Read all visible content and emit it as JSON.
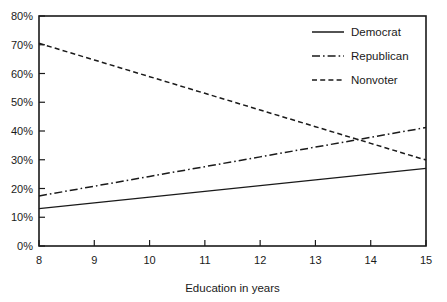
{
  "chart_data": {
    "type": "line",
    "title": "",
    "xlabel": "Education in years",
    "ylabel": "",
    "x": [
      8,
      9,
      10,
      11,
      12,
      13,
      14,
      15
    ],
    "xlim": [
      8,
      15
    ],
    "ylim": [
      0,
      80
    ],
    "grid": false,
    "legend_position": "top-right",
    "x_ticks": [
      "8",
      "9",
      "10",
      "11",
      "12",
      "13",
      "14",
      "15"
    ],
    "y_ticks": [
      "0%",
      "10%",
      "20%",
      "30%",
      "40%",
      "50%",
      "60%",
      "70%",
      "80%"
    ],
    "y_tick_values": [
      0,
      10,
      20,
      30,
      40,
      50,
      60,
      70,
      80
    ],
    "series": [
      {
        "name": "Democrat",
        "style": "solid",
        "color": "#1a1a1a",
        "values": [
          13,
          15,
          17,
          19,
          21,
          23,
          25,
          27
        ]
      },
      {
        "name": "Republican",
        "style": "dash-dot",
        "color": "#1a1a1a",
        "values": [
          17.4,
          20.8,
          24.2,
          27.6,
          31.0,
          34.4,
          37.8,
          41.2
        ]
      },
      {
        "name": "Nonvoter",
        "style": "dashed",
        "color": "#1a1a1a",
        "values": [
          70.5,
          64.7,
          58.9,
          53.1,
          47.3,
          41.5,
          35.7,
          29.9
        ]
      }
    ]
  },
  "legend": {
    "entries": [
      {
        "label": "Democrat",
        "style": "solid"
      },
      {
        "label": "Republican",
        "style": "dash-dot"
      },
      {
        "label": "Nonvoter",
        "style": "dashed"
      }
    ]
  },
  "axes": {
    "x_title": "Education in years"
  },
  "colors": {
    "ink": "#1a1a1a",
    "background": "#ffffff"
  }
}
